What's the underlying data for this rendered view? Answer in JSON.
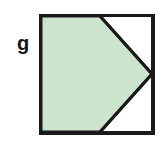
{
  "figure": {
    "name": "square-with-inscribed-pentagon",
    "background_color": "#ffffff",
    "label": {
      "text": "g",
      "color": "#151515",
      "x": 17,
      "y": 50,
      "font_size": 20,
      "bold": true
    },
    "square": {
      "name": "outer-square",
      "x": 40,
      "y": 15,
      "width": 113,
      "height": 118,
      "stroke_color": "#1a1a1a",
      "stroke_width": 3,
      "fill": "#ffffff"
    },
    "shaded_region": {
      "name": "shaded-pentagon",
      "fill_color": "#cce4cb",
      "stroke_color": "#1a1a1a",
      "stroke_width": 3,
      "description": "Pentagon: left side of square plus a rightward point touching the midpoint of the right edge",
      "points": "41,16 100,16 152,74 100,132 41,132",
      "vertices": [
        {
          "name": "top-left-corner",
          "x": 41,
          "y": 16
        },
        {
          "name": "top-edge-point",
          "x": 100,
          "y": 16
        },
        {
          "name": "right-vertex",
          "x": 152,
          "y": 74
        },
        {
          "name": "bottom-edge-point",
          "x": 100,
          "y": 132
        },
        {
          "name": "bottom-left-corner",
          "x": 41,
          "y": 132
        }
      ]
    },
    "unshaded_regions": [
      {
        "name": "upper-right-triangle",
        "fill_color": "#ffffff",
        "points": "100,16 152,16 152,74"
      },
      {
        "name": "lower-right-triangle",
        "fill_color": "#ffffff",
        "points": "100,132 152,132 152,74"
      }
    ]
  }
}
